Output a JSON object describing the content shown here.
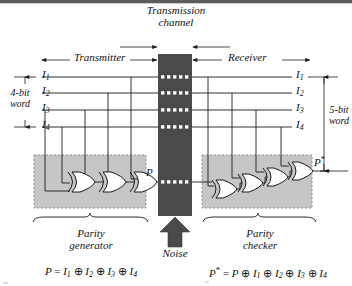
{
  "figure": {
    "type": "logic-circuit-diagram",
    "colors": {
      "channel": "#4a4a4a",
      "shaded_block": "#c6c6c6",
      "wire": "#1a1a1a",
      "dashed_border": "#8a8a8a",
      "noise_arrow": "#4a4a4a",
      "page": "#ffffff"
    }
  },
  "labels": {
    "transmission_channel_line1": "Transmission",
    "transmission_channel_line2": "channel",
    "transmitter": "Transmitter",
    "receiver": "Receiver",
    "noise": "Noise",
    "word_left_line1": "4-bit",
    "word_left_line2": "word",
    "word_right_line1": "5-bit",
    "word_right_line2": "word",
    "parity_generator_line1": "Parity",
    "parity_generator_line2": "generator",
    "parity_checker_line1": "Parity",
    "parity_checker_line2": "checker"
  },
  "signals": {
    "left": [
      {
        "name": "I",
        "sub": "1"
      },
      {
        "name": "I",
        "sub": "2"
      },
      {
        "name": "I",
        "sub": "3"
      },
      {
        "name": "I",
        "sub": "4"
      }
    ],
    "right": [
      {
        "name": "I",
        "sub": "1"
      },
      {
        "name": "I",
        "sub": "2"
      },
      {
        "name": "I",
        "sub": "3"
      },
      {
        "name": "I",
        "sub": "4"
      }
    ],
    "parity_out": "P",
    "parity_check_out": "P",
    "parity_check_out_prime": "*"
  },
  "equations": {
    "generator": {
      "lhs": "P",
      "rhs_terms": [
        "I1",
        "I2",
        "I3",
        "I4"
      ],
      "text": "P = I1 ⊕ I2 ⊕ I3 ⊕ I4"
    },
    "checker": {
      "lhs": "P*",
      "rhs_terms": [
        "P",
        "I1",
        "I2",
        "I3",
        "I4"
      ],
      "text": "P* = P ⊕ I1 ⊕ I2 ⊕ I3 ⊕ I4"
    }
  },
  "equation_parts": {
    "gen_lhs": "P",
    "gen_eq": "=",
    "chk_lhs": "P",
    "chk_prime": "*",
    "chk_eq": "=",
    "xor": "⊕",
    "I": "I",
    "P": "P",
    "s1": "1",
    "s2": "2",
    "s3": "3",
    "s4": "4"
  },
  "gates": {
    "generator_count": 3,
    "checker_count": 4,
    "type": "XOR"
  }
}
